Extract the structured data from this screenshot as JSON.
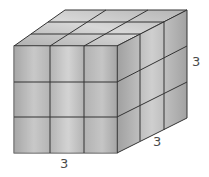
{
  "diagram": {
    "type": "rectangular-prism-of-unit-cubes",
    "dimensions": {
      "width": 3,
      "depth": 3,
      "height": 3
    },
    "labels": {
      "width": "3",
      "depth": "3",
      "height": "3"
    },
    "colors": {
      "face_light": "#d8d8d8",
      "face_mid": "#b8b8b8",
      "face_dark": "#9a9a9a",
      "edge": "#333333",
      "label": "#4a4a4a"
    }
  }
}
